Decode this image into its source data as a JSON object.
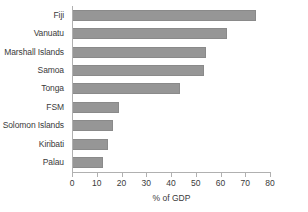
{
  "chart_data": {
    "type": "bar",
    "orientation": "horizontal",
    "title": "",
    "xlabel": "% of GDP",
    "ylabel": "",
    "xlim": [
      0,
      80
    ],
    "xticks": [
      0,
      10,
      20,
      30,
      40,
      50,
      60,
      70,
      80
    ],
    "grid": false,
    "legend": false,
    "bar_color": "#969696",
    "categories": [
      "Fiji",
      "Vanuatu",
      "Marshall Islands",
      "Samoa",
      "Tonga",
      "FSM",
      "Solomon Islands",
      "Kiribati",
      "Palau"
    ],
    "values": [
      74.5,
      62.5,
      54,
      53.5,
      43.5,
      19,
      16.5,
      14.5,
      12.5
    ]
  }
}
